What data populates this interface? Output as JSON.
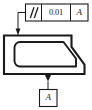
{
  "drawing": {
    "type": "gdt-engineering-drawing",
    "title": "Parallelism tolerance callout",
    "width": 92,
    "height": 110,
    "background_color": "#ffffff",
    "line_color": "#1a1a1a"
  },
  "feature_control_frame": {
    "name": "feature-control-frame",
    "cells": [
      {
        "kind": "geometric-characteristic-symbol",
        "symbol_name": "parallelism-symbol",
        "label": "//"
      },
      {
        "kind": "tolerance-value",
        "label": "0.01"
      },
      {
        "kind": "datum-reference",
        "label": "A"
      }
    ]
  },
  "datum_feature": {
    "name": "datum-feature-symbol",
    "label": "A",
    "triangle": "filled",
    "attached_edge": "bottom-face"
  },
  "leader": {
    "name": "leader-line",
    "arrowhead": "filled",
    "points_to": "top-face"
  },
  "part": {
    "name": "part-outline",
    "description": "bracket profile with internal slot and chamfered right step"
  }
}
